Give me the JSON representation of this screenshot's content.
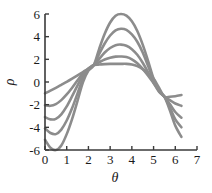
{
  "chart_data": {
    "type": "line",
    "title": "",
    "subtitle": "",
    "xlabel": "θ",
    "ylabel": "ρ",
    "xlim": [
      0,
      7
    ],
    "ylim": [
      -6,
      6
    ],
    "xticks": [
      0,
      1,
      2,
      3,
      4,
      5,
      6,
      7
    ],
    "xtick_labels": [
      "0",
      "1",
      "2",
      "3",
      "4",
      "5",
      "6",
      "7"
    ],
    "yticks": [
      -6,
      -4,
      -2,
      0,
      2,
      4,
      6
    ],
    "ytick_labels": [
      "-6",
      "-4",
      "-2",
      "0",
      "2",
      "4",
      "6"
    ],
    "grid": false,
    "legend": "none",
    "annotations": [],
    "line_color": "#8c8c8c",
    "line_width": 2.6,
    "x_domain_data": [
      0.0,
      6.283
    ],
    "crossing_points": [
      {
        "x": 2.25,
        "y": 1.5
      },
      {
        "x": 5.5,
        "y": -1.3
      }
    ],
    "series": [
      {
        "name": "curve-1",
        "start_y": -1.0,
        "peak_x": 3.55,
        "peak_y": 1.6,
        "min_y": -1.3,
        "end_y": -1.15,
        "x": [
          0.0,
          0.25,
          0.5,
          0.75,
          1.0,
          1.25,
          1.5,
          1.75,
          2.0,
          2.25,
          2.5,
          2.75,
          3.0,
          3.25,
          3.5,
          3.75,
          4.0,
          4.25,
          4.5,
          4.75,
          5.0,
          5.25,
          5.5,
          5.75,
          6.0,
          6.283
        ],
        "values": [
          -1.0,
          -0.76,
          -0.51,
          -0.25,
          0.01,
          0.29,
          0.58,
          0.88,
          1.18,
          1.5,
          1.54,
          1.58,
          1.6,
          1.6,
          1.6,
          1.6,
          1.54,
          1.4,
          1.13,
          0.74,
          0.3,
          -0.5,
          -1.3,
          -1.3,
          -1.25,
          -1.15
        ]
      },
      {
        "name": "curve-2",
        "start_y": -2.05,
        "peak_x": 3.6,
        "peak_y": 2.25,
        "min_y": -2.2,
        "end_y": -2.1,
        "x": [
          0.0,
          0.25,
          0.5,
          0.75,
          1.0,
          1.25,
          1.5,
          1.75,
          2.0,
          2.25,
          2.5,
          2.75,
          3.0,
          3.25,
          3.5,
          3.75,
          4.0,
          4.25,
          4.5,
          4.75,
          5.0,
          5.25,
          5.5,
          5.75,
          6.0,
          6.283
        ],
        "values": [
          -2.05,
          -2.1,
          -1.95,
          -1.6,
          -1.1,
          -0.5,
          0.15,
          0.75,
          1.2,
          1.5,
          1.75,
          1.98,
          2.15,
          2.24,
          2.25,
          2.2,
          2.0,
          1.65,
          1.15,
          0.55,
          -0.1,
          -0.75,
          -1.3,
          -1.6,
          -1.9,
          -2.1
        ]
      },
      {
        "name": "curve-3",
        "start_y": -3.1,
        "peak_x": 3.6,
        "peak_y": 3.3,
        "min_y": -3.35,
        "end_y": -3.15,
        "x": [
          0.0,
          0.25,
          0.5,
          0.75,
          1.0,
          1.25,
          1.5,
          1.75,
          2.0,
          2.25,
          2.5,
          2.75,
          3.0,
          3.25,
          3.5,
          3.75,
          4.0,
          4.25,
          4.5,
          4.75,
          5.0,
          5.25,
          5.5,
          5.75,
          6.0,
          6.283
        ],
        "values": [
          -3.1,
          -3.3,
          -3.25,
          -2.85,
          -2.15,
          -1.25,
          -0.3,
          0.6,
          1.15,
          1.5,
          2.05,
          2.6,
          3.0,
          3.25,
          3.3,
          3.2,
          2.9,
          2.4,
          1.7,
          0.85,
          -0.05,
          -0.85,
          -1.3,
          -1.95,
          -2.65,
          -3.15
        ]
      },
      {
        "name": "curve-4",
        "start_y": -4.1,
        "peak_x": 3.6,
        "peak_y": 4.7,
        "min_y": -4.65,
        "end_y": -4.0,
        "x": [
          0.0,
          0.25,
          0.5,
          0.75,
          1.0,
          1.25,
          1.5,
          1.75,
          2.0,
          2.25,
          2.5,
          2.75,
          3.0,
          3.25,
          3.5,
          3.75,
          4.0,
          4.25,
          4.5,
          4.75,
          5.0,
          5.25,
          5.5,
          5.75,
          6.0,
          6.283
        ],
        "values": [
          -4.1,
          -4.5,
          -4.6,
          -4.2,
          -3.4,
          -2.3,
          -1.0,
          0.3,
          1.1,
          1.5,
          2.5,
          3.4,
          4.1,
          4.55,
          4.7,
          4.6,
          4.2,
          3.55,
          2.6,
          1.4,
          0.15,
          -0.8,
          -1.3,
          -2.25,
          -3.3,
          -4.0
        ]
      },
      {
        "name": "curve-5",
        "start_y": -5.1,
        "peak_x": 3.6,
        "peak_y": 6.0,
        "min_y": -6.0,
        "end_y": -4.85,
        "x": [
          0.0,
          0.25,
          0.5,
          0.75,
          1.0,
          1.25,
          1.5,
          1.75,
          2.0,
          2.25,
          2.5,
          2.75,
          3.0,
          3.25,
          3.5,
          3.75,
          4.0,
          4.25,
          4.5,
          4.75,
          5.0,
          5.25,
          5.5,
          5.75,
          6.0,
          6.283
        ],
        "values": [
          -5.1,
          -5.8,
          -6.0,
          -5.6,
          -4.6,
          -3.25,
          -1.65,
          0.0,
          1.0,
          1.5,
          2.95,
          4.25,
          5.25,
          5.85,
          6.0,
          5.85,
          5.35,
          4.5,
          3.3,
          1.85,
          0.3,
          -0.75,
          -1.3,
          -2.5,
          -3.85,
          -4.85
        ]
      }
    ]
  },
  "axes": {
    "x_axis_name": "theta-axis",
    "y_axis_name": "rho-axis"
  }
}
